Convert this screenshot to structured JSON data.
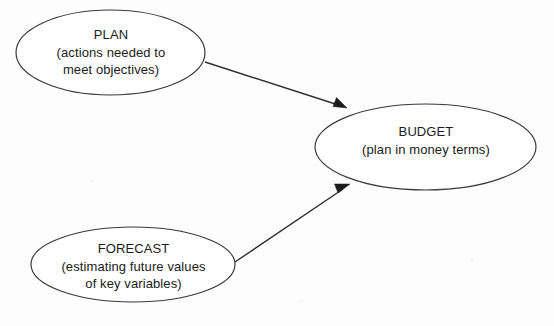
{
  "diagram": {
    "type": "concept-flow",
    "background_color": "#fdfdfd",
    "stroke_color": "#3a3a3a",
    "text_color": "#1b1b1b",
    "nodes": [
      {
        "id": "plan",
        "shape": "ellipse",
        "title": "PLAN",
        "subtitle_line1": "(actions needed to",
        "subtitle_line2": "meet objectives)",
        "cx": 110.5,
        "cy": 52.5,
        "rx": 94.5,
        "ry": 42.5
      },
      {
        "id": "budget",
        "shape": "ellipse",
        "title": "BUDGET",
        "subtitle_line1": "(plan in money terms)",
        "subtitle_line2": "",
        "cx": 425.5,
        "cy": 147,
        "rx": 110.5,
        "ry": 43
      },
      {
        "id": "forecast",
        "shape": "ellipse",
        "title": "FORECAST",
        "subtitle_line1": "(estimating future values",
        "subtitle_line2": "of key variables)",
        "cx": 133,
        "cy": 264.5,
        "rx": 102,
        "ry": 37.5
      }
    ],
    "edges": [
      {
        "id": "plan-to-budget",
        "from": "plan",
        "to": "budget",
        "label": "",
        "x1": 205,
        "y1": 62,
        "x2": 345,
        "y2": 107,
        "arrowhead": "filled-triangle"
      },
      {
        "id": "forecast-to-budget",
        "from": "forecast",
        "to": "budget",
        "label": "",
        "x1": 235,
        "y1": 262,
        "x2": 348,
        "y2": 185,
        "arrowhead": "filled-triangle"
      }
    ]
  }
}
